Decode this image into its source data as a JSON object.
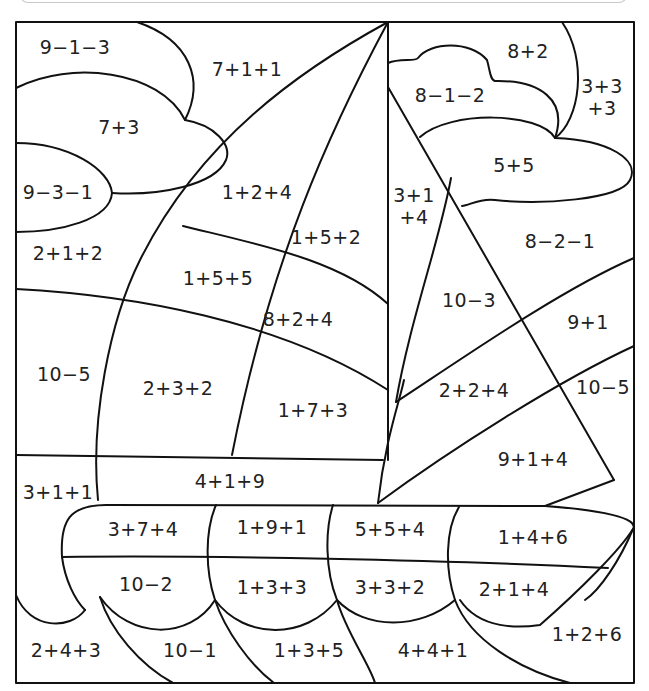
{
  "worksheet": {
    "title": "",
    "picture": "sailboat",
    "regions": [
      {
        "id": "cloud-left-top",
        "problem": "9−1−3",
        "x": 75,
        "y": 48
      },
      {
        "id": "sky-left",
        "problem": "7+1+1",
        "x": 247,
        "y": 70
      },
      {
        "id": "cloud-left-mid",
        "problem": "7+3",
        "x": 119,
        "y": 128
      },
      {
        "id": "cloud-left-bottom",
        "problem": "9−3−1",
        "x": 58,
        "y": 193
      },
      {
        "id": "sail-left-top",
        "problem": "1+2+4",
        "x": 257,
        "y": 193
      },
      {
        "id": "sail-left-strip",
        "problem": "1+5+2",
        "x": 326,
        "y": 238
      },
      {
        "id": "sea-left-1",
        "problem": "2+1+2",
        "x": 68,
        "y": 254
      },
      {
        "id": "sail-left-a",
        "problem": "1+5+5",
        "x": 218,
        "y": 279
      },
      {
        "id": "sail-left-b",
        "problem": "8+2+4",
        "x": 298,
        "y": 320
      },
      {
        "id": "sea-left-2",
        "problem": "10−5",
        "x": 64,
        "y": 375
      },
      {
        "id": "sail-left-c",
        "problem": "2+3+2",
        "x": 178,
        "y": 389
      },
      {
        "id": "sail-left-d",
        "problem": "1+7+3",
        "x": 313,
        "y": 411
      },
      {
        "id": "cloud-right-top",
        "problem": "8+2",
        "x": 528,
        "y": 52
      },
      {
        "id": "sky-right-edge",
        "problem": "3+3\n+3",
        "x": 602,
        "y": 98
      },
      {
        "id": "cloud-right-mid",
        "problem": "8−1−2",
        "x": 450,
        "y": 96
      },
      {
        "id": "cloud-right-bottom",
        "problem": "5+5",
        "x": 514,
        "y": 166
      },
      {
        "id": "sail-right-strip",
        "problem": "3+1\n+4",
        "x": 414,
        "y": 207
      },
      {
        "id": "sky-right-lower",
        "problem": "8−2−1",
        "x": 560,
        "y": 242
      },
      {
        "id": "sail-right-a",
        "problem": "10−3",
        "x": 469,
        "y": 301
      },
      {
        "id": "sea-right-1",
        "problem": "9+1",
        "x": 588,
        "y": 323
      },
      {
        "id": "sail-right-b",
        "problem": "2+2+4",
        "x": 474,
        "y": 391
      },
      {
        "id": "sea-right-2",
        "problem": "10−5",
        "x": 603,
        "y": 388
      },
      {
        "id": "sail-right-c",
        "problem": "9+1+4",
        "x": 533,
        "y": 460
      },
      {
        "id": "sea-left-3",
        "problem": "3+1+1",
        "x": 58,
        "y": 493
      },
      {
        "id": "deck",
        "problem": "4+1+9",
        "x": 230,
        "y": 482
      },
      {
        "id": "hull-top-1",
        "problem": "3+7+4",
        "x": 143,
        "y": 530
      },
      {
        "id": "hull-top-2",
        "problem": "1+9+1",
        "x": 272,
        "y": 528
      },
      {
        "id": "hull-top-3",
        "problem": "5+5+4",
        "x": 390,
        "y": 530
      },
      {
        "id": "hull-top-4",
        "problem": "1+4+6",
        "x": 533,
        "y": 538
      },
      {
        "id": "hull-bottom-1",
        "problem": "10−2",
        "x": 146,
        "y": 585
      },
      {
        "id": "hull-bottom-2",
        "problem": "1+3+3",
        "x": 272,
        "y": 588
      },
      {
        "id": "hull-bottom-3",
        "problem": "3+3+2",
        "x": 390,
        "y": 588
      },
      {
        "id": "hull-bottom-4",
        "problem": "2+1+4",
        "x": 514,
        "y": 590
      },
      {
        "id": "wave-right",
        "problem": "1+2+6",
        "x": 587,
        "y": 635
      },
      {
        "id": "wave-1",
        "problem": "2+4+3",
        "x": 66,
        "y": 651
      },
      {
        "id": "wave-2",
        "problem": "10−1",
        "x": 190,
        "y": 651
      },
      {
        "id": "wave-3",
        "problem": "1+3+5",
        "x": 309,
        "y": 651
      },
      {
        "id": "wave-4",
        "problem": "4+4+1",
        "x": 433,
        "y": 651
      }
    ]
  }
}
